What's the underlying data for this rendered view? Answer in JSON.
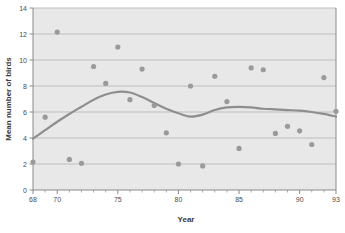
{
  "chart_data": {
    "type": "scatter",
    "title": "",
    "xlabel": "Year",
    "ylabel": "Mean number of birds",
    "xlim": [
      68,
      93
    ],
    "ylim": [
      0,
      14
    ],
    "xticks": [
      68,
      70,
      75,
      80,
      85,
      90,
      93
    ],
    "xtick_labels": [
      "68",
      "70",
      "75",
      "80",
      "85",
      "90",
      "93"
    ],
    "xminor_step": 1,
    "yticks": [
      0,
      2,
      4,
      6,
      8,
      10,
      12,
      14
    ],
    "ytick_labels": [
      "0",
      "2",
      "4",
      "6",
      "8",
      "10",
      "12",
      "14"
    ],
    "grid": "horizontal",
    "legend": "none",
    "plot_background": "#e8e8e8",
    "point_color": "#9a9a9a",
    "line_color": "#8e8e8e",
    "grid_color": "#b4b4b4",
    "axis_color": "#8a8a8a",
    "point_radius": 2.6,
    "line_width": 2.2,
    "series": [
      {
        "name": "Mean number of birds",
        "kind": "scatter",
        "x": [
          68,
          69,
          70,
          71,
          72,
          73,
          74,
          75,
          76,
          77,
          78,
          79,
          80,
          81,
          82,
          83,
          84,
          85,
          86,
          87,
          88,
          89,
          90,
          91,
          92,
          93
        ],
        "y": [
          2.15,
          5.6,
          12.15,
          2.35,
          2.05,
          9.5,
          8.2,
          11.0,
          6.95,
          9.3,
          6.5,
          4.4,
          2.0,
          8.0,
          1.85,
          8.75,
          6.8,
          3.2,
          9.4,
          9.25,
          4.35,
          4.9,
          4.55,
          3.5,
          8.65,
          6.05
        ]
      },
      {
        "name": "Smoothed trend",
        "kind": "line",
        "x": [
          68,
          69,
          70,
          71,
          72,
          73,
          74,
          75,
          76,
          77,
          78,
          79,
          80,
          81,
          82,
          83,
          84,
          85,
          86,
          87,
          88,
          89,
          90,
          91,
          92,
          93
        ],
        "y": [
          3.95,
          4.6,
          5.25,
          5.85,
          6.4,
          6.95,
          7.35,
          7.55,
          7.5,
          7.15,
          6.7,
          6.25,
          5.9,
          5.65,
          5.8,
          6.15,
          6.35,
          6.4,
          6.35,
          6.25,
          6.2,
          6.15,
          6.1,
          6.0,
          5.85,
          5.65
        ]
      }
    ]
  }
}
